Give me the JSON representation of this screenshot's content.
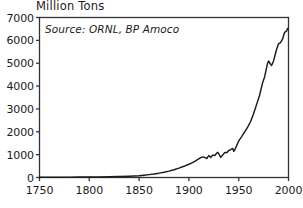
{
  "chart_data": {
    "type": "line",
    "title": "Million Tons",
    "xlabel": "",
    "ylabel": "",
    "annotation": "Source: ORNL, BP Amoco",
    "xlim": [
      1750,
      2000
    ],
    "ylim": [
      0,
      7000
    ],
    "xticks": [
      1750,
      1800,
      1850,
      1900,
      1950,
      2000
    ],
    "yticks": [
      0,
      1000,
      2000,
      3000,
      4000,
      5000,
      6000,
      7000
    ],
    "xtick_labels": [
      "1750",
      "1800",
      "1850",
      "1900",
      "1950",
      "2000"
    ],
    "ytick_labels": [
      "0",
      "1000",
      "2000",
      "3000",
      "4000",
      "5000",
      "6000",
      "7000"
    ],
    "grid": false,
    "legend": false,
    "line_color": "#1a1a1a",
    "frame_color": "#333333",
    "background": "#ffffff",
    "series": [
      {
        "name": "Carbon emissions",
        "x": [
          1750,
          1760,
          1770,
          1780,
          1790,
          1800,
          1810,
          1820,
          1830,
          1840,
          1850,
          1855,
          1860,
          1865,
          1870,
          1875,
          1880,
          1885,
          1890,
          1895,
          1900,
          1903,
          1906,
          1909,
          1912,
          1914,
          1916,
          1918,
          1919,
          1920,
          1922,
          1924,
          1926,
          1928,
          1929,
          1930,
          1932,
          1934,
          1936,
          1938,
          1940,
          1942,
          1944,
          1945,
          1946,
          1948,
          1950,
          1953,
          1956,
          1959,
          1962,
          1965,
          1968,
          1971,
          1974,
          1976,
          1979,
          1980,
          1982,
          1983,
          1985,
          1988,
          1990,
          1992,
          1994,
          1996,
          1998,
          1999
        ],
        "y": [
          10,
          12,
          14,
          16,
          19,
          22,
          26,
          32,
          42,
          58,
          80,
          100,
          125,
          155,
          190,
          230,
          280,
          340,
          410,
          490,
          580,
          640,
          710,
          790,
          870,
          900,
          880,
          830,
          900,
          960,
          880,
          980,
          960,
          1070,
          1100,
          1040,
          880,
          980,
          1100,
          1080,
          1180,
          1220,
          1270,
          1150,
          1200,
          1400,
          1600,
          1790,
          2000,
          2200,
          2450,
          2800,
          3200,
          3600,
          4150,
          4400,
          5000,
          5100,
          4950,
          4900,
          5100,
          5600,
          5850,
          5900,
          6050,
          6350,
          6400,
          6520
        ]
      }
    ]
  }
}
